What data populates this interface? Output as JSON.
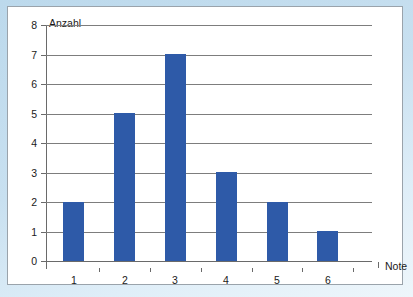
{
  "chart_data": {
    "type": "bar",
    "title": "",
    "xlabel": "Note",
    "ylabel": "Anzahl",
    "categories": [
      "1",
      "2",
      "3",
      "4",
      "5",
      "6"
    ],
    "values": [
      2,
      5,
      7,
      3,
      2,
      1
    ],
    "ylim": [
      0,
      8
    ],
    "y_ticks": [
      "0",
      "1",
      "2",
      "3",
      "4",
      "5",
      "6",
      "7",
      "8"
    ],
    "grid": true,
    "legend": "none",
    "series_color": "#2e5aa8",
    "axis_color": "#6a6a6a",
    "grid_color": "#7d7d7d",
    "background": "#ffffff",
    "page_background": "#c8e0f0"
  },
  "axes": {
    "y_title": "Anzahl",
    "x_title": "Note"
  }
}
